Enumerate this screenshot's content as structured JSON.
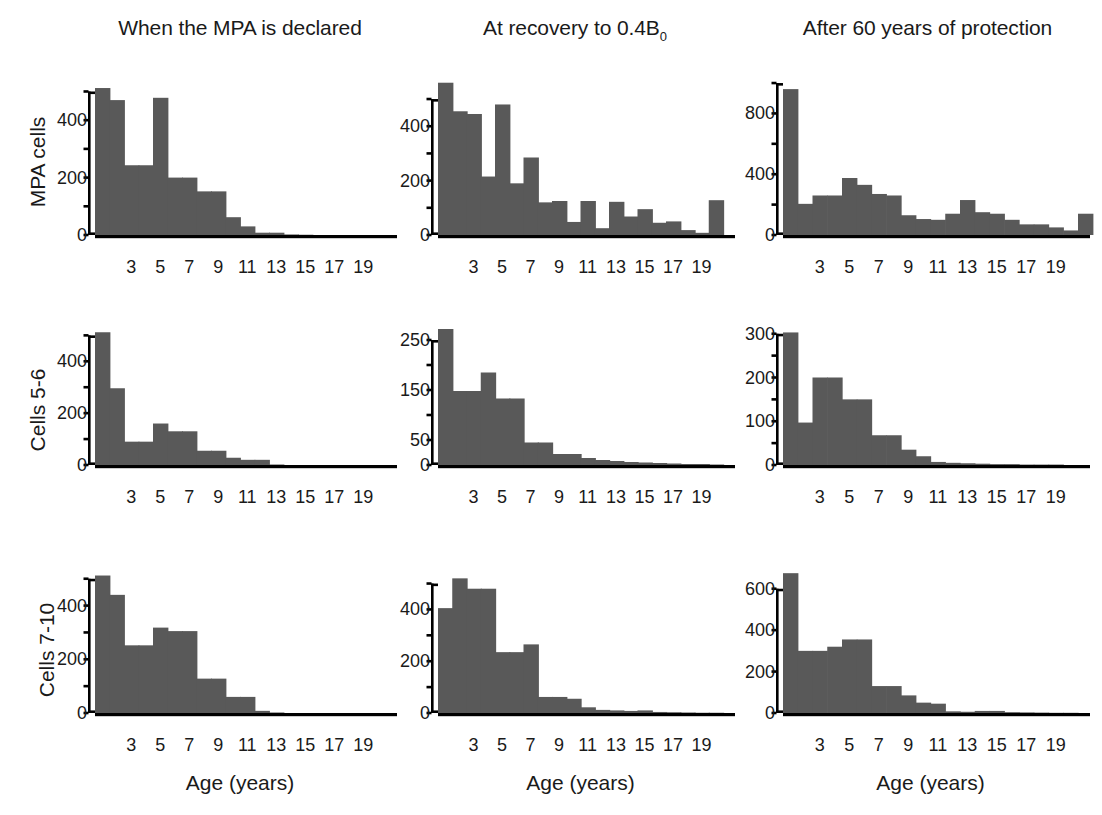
{
  "figure": {
    "columns": [
      {
        "id": "declared",
        "title": "When the MPA is declared",
        "title_sub": ""
      },
      {
        "id": "recovery",
        "title": "At recovery to 0.4B",
        "title_sub": "0"
      },
      {
        "id": "sixtyyear",
        "title": "After 60 years of protection",
        "title_sub": ""
      }
    ],
    "rows": [
      {
        "id": "mpa-cells",
        "label": "MPA cells"
      },
      {
        "id": "cells-5-6",
        "label": "Cells 5-6"
      },
      {
        "id": "cells-7-10",
        "label": "Cells 7-10"
      }
    ],
    "xaxis_title": "Age (years)",
    "xtick_labels": [
      "3",
      "5",
      "7",
      "9",
      "11",
      "13",
      "15",
      "17",
      "19"
    ],
    "bar_color": "#595959",
    "axis_color": "#000000"
  },
  "chart_data": [
    {
      "id": "mpa-cells-declared",
      "type": "bar",
      "title": "When the MPA is declared",
      "row_label": "MPA cells",
      "xlabel": "Age (years)",
      "ylabel": "MPA cells",
      "ylim": [
        0,
        540
      ],
      "ytick_values": [
        0,
        100,
        200,
        300,
        400,
        500
      ],
      "ytick_labels": [
        "0",
        "",
        "200",
        "",
        "400",
        ""
      ],
      "xlim": [
        1,
        21
      ],
      "x": [
        1,
        2,
        3,
        4,
        5,
        6,
        7,
        8,
        9,
        10,
        11,
        12,
        13,
        14,
        15,
        16,
        17,
        18,
        19,
        20
      ],
      "values": [
        512,
        470,
        243,
        243,
        478,
        200,
        200,
        152,
        152,
        62,
        30,
        8,
        8,
        2,
        1,
        0,
        0,
        0,
        0,
        0
      ]
    },
    {
      "id": "mpa-cells-recovery",
      "type": "bar",
      "title": "At recovery to 0.4B0",
      "row_label": "MPA cells",
      "xlabel": "Age (years)",
      "ylabel": "MPA cells",
      "ylim": [
        0,
        570
      ],
      "ytick_values": [
        0,
        100,
        200,
        300,
        400,
        500
      ],
      "ytick_labels": [
        "0",
        "",
        "200",
        "",
        "400",
        ""
      ],
      "xlim": [
        1,
        21
      ],
      "x": [
        1,
        2,
        3,
        4,
        5,
        6,
        7,
        8,
        9,
        10,
        11,
        12,
        13,
        14,
        15,
        16,
        17,
        18,
        19,
        20
      ],
      "values": [
        560,
        455,
        445,
        215,
        480,
        190,
        285,
        120,
        125,
        48,
        125,
        25,
        122,
        68,
        95,
        45,
        50,
        18,
        8,
        128
      ]
    },
    {
      "id": "mpa-cells-sixtyyear",
      "type": "bar",
      "title": "After 60 years of protection",
      "row_label": "MPA cells",
      "xlabel": "Age (years)",
      "ylabel": "MPA cells",
      "ylim": [
        0,
        1020
      ],
      "ytick_values": [
        0,
        200,
        400,
        600,
        800,
        1000
      ],
      "ytick_labels": [
        "0",
        "",
        "400",
        "",
        "800",
        ""
      ],
      "xlim": [
        1,
        21
      ],
      "x": [
        1,
        2,
        3,
        4,
        5,
        6,
        7,
        8,
        9,
        10,
        11,
        12,
        13,
        14,
        15,
        16,
        17,
        18,
        19,
        20
      ],
      "values": [
        960,
        205,
        260,
        260,
        375,
        330,
        270,
        260,
        130,
        105,
        100,
        140,
        230,
        150,
        140,
        100,
        70,
        70,
        50,
        30,
        140
      ]
    },
    {
      "id": "cells-5-6-declared",
      "type": "bar",
      "title": "When the MPA is declared",
      "row_label": "Cells 5-6",
      "xlabel": "Age (years)",
      "ylabel": "Cells 5-6",
      "ylim": [
        0,
        540
      ],
      "ytick_values": [
        0,
        100,
        200,
        300,
        400,
        500
      ],
      "ytick_labels": [
        "0",
        "",
        "200",
        "",
        "400",
        ""
      ],
      "xlim": [
        1,
        21
      ],
      "x": [
        1,
        2,
        3,
        4,
        5,
        6,
        7,
        8,
        9,
        10,
        11,
        12,
        13,
        14,
        15,
        16,
        17,
        18,
        19,
        20
      ],
      "values": [
        512,
        296,
        90,
        90,
        160,
        130,
        130,
        55,
        55,
        28,
        20,
        20,
        2,
        0,
        0,
        0,
        0,
        0,
        0,
        0
      ]
    },
    {
      "id": "cells-5-6-recovery",
      "type": "bar",
      "title": "At recovery to 0.4B0",
      "row_label": "Cells 5-6",
      "xlabel": "Age (years)",
      "ylabel": "Cells 5-6",
      "ylim": [
        0,
        280
      ],
      "ytick_values": [
        0,
        50,
        100,
        150,
        200,
        250
      ],
      "ytick_labels": [
        "0",
        "50",
        "",
        "150",
        "",
        "250"
      ],
      "xlim": [
        1,
        21
      ],
      "x": [
        1,
        2,
        3,
        4,
        5,
        6,
        7,
        8,
        9,
        10,
        11,
        12,
        13,
        14,
        15,
        16,
        17,
        18,
        19,
        20
      ],
      "values": [
        272,
        148,
        148,
        185,
        133,
        133,
        45,
        45,
        22,
        22,
        14,
        10,
        8,
        6,
        5,
        4,
        3,
        2,
        2,
        1
      ]
    },
    {
      "id": "cells-5-6-sixtyyear",
      "type": "bar",
      "title": "After 60 years of protection",
      "row_label": "Cells 5-6",
      "xlabel": "Age (years)",
      "ylabel": "Cells 5-6",
      "ylim": [
        0,
        320
      ],
      "ytick_values": [
        0,
        50,
        100,
        150,
        200,
        250,
        300
      ],
      "ytick_labels": [
        "0",
        "",
        "100",
        "",
        "200",
        "",
        "300"
      ],
      "xlim": [
        1,
        21
      ],
      "x": [
        1,
        2,
        3,
        4,
        5,
        6,
        7,
        8,
        9,
        10,
        11,
        12,
        13,
        14,
        15,
        16,
        17,
        18,
        19,
        20
      ],
      "values": [
        303,
        97,
        200,
        200,
        150,
        150,
        68,
        68,
        35,
        20,
        7,
        5,
        4,
        3,
        2,
        2,
        1,
        1,
        1,
        0
      ]
    },
    {
      "id": "cells-7-10-declared",
      "type": "bar",
      "title": "When the MPA is declared",
      "row_label": "Cells 7-10",
      "xlabel": "Age (years)",
      "ylabel": "Cells 7-10",
      "ylim": [
        0,
        540
      ],
      "ytick_values": [
        0,
        100,
        200,
        300,
        400,
        500
      ],
      "ytick_labels": [
        "0",
        "",
        "200",
        "",
        "400",
        ""
      ],
      "xlim": [
        1,
        21
      ],
      "x": [
        1,
        2,
        3,
        4,
        5,
        6,
        7,
        8,
        9,
        10,
        11,
        12,
        13,
        14,
        15,
        16,
        17,
        18,
        19,
        20
      ],
      "values": [
        512,
        440,
        252,
        252,
        318,
        305,
        305,
        128,
        128,
        60,
        60,
        8,
        2,
        0,
        0,
        0,
        0,
        0,
        0,
        0
      ]
    },
    {
      "id": "cells-7-10-recovery",
      "type": "bar",
      "title": "At recovery to 0.4B0",
      "row_label": "Cells 7-10",
      "xlabel": "Age (years)",
      "ylabel": "Cells 7-10",
      "ylim": [
        0,
        560
      ],
      "ytick_values": [
        0,
        100,
        200,
        300,
        400,
        500
      ],
      "ytick_labels": [
        "0",
        "",
        "200",
        "",
        "400",
        ""
      ],
      "xlim": [
        1,
        21
      ],
      "x": [
        1,
        2,
        3,
        4,
        5,
        6,
        7,
        8,
        9,
        10,
        11,
        12,
        13,
        14,
        15,
        16,
        17,
        18,
        19,
        20
      ],
      "values": [
        405,
        520,
        480,
        480,
        235,
        235,
        265,
        62,
        62,
        55,
        22,
        12,
        10,
        8,
        10,
        4,
        3,
        2,
        1,
        1
      ]
    },
    {
      "id": "cells-7-10-sixtyyear",
      "type": "bar",
      "title": "After 60 years of protection",
      "row_label": "Cells 7-10",
      "xlabel": "Age (years)",
      "ylabel": "Cells 7-10",
      "ylim": [
        0,
        700
      ],
      "ytick_values": [
        0,
        200,
        400,
        600
      ],
      "ytick_labels": [
        "0",
        "200",
        "400",
        "600"
      ],
      "xlim": [
        1,
        21
      ],
      "x": [
        1,
        2,
        3,
        4,
        5,
        6,
        7,
        8,
        9,
        10,
        11,
        12,
        13,
        14,
        15,
        16,
        17,
        18,
        19,
        20
      ],
      "values": [
        675,
        300,
        300,
        320,
        355,
        355,
        130,
        130,
        85,
        50,
        45,
        8,
        6,
        10,
        10,
        4,
        3,
        2,
        1,
        1
      ]
    }
  ]
}
